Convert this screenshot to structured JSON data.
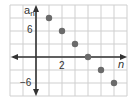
{
  "chart_data": {
    "type": "scatter",
    "title": "",
    "xlabel": "n",
    "ylabel": "a_n",
    "ylabel_display": {
      "base": "a",
      "sub": "n"
    },
    "x": [
      1,
      2,
      3,
      4,
      5,
      6
    ],
    "series": [
      {
        "name": "a_n",
        "values": [
          9,
          6,
          3,
          0,
          -3,
          -6
        ],
        "color": "#6b6b6b"
      }
    ],
    "x_tick_labels": [
      "2"
    ],
    "y_tick_labels": [
      "6",
      "−6"
    ],
    "xlim": [
      -2,
      7
    ],
    "ylim": [
      -9,
      12
    ],
    "grid": true,
    "grid_step": {
      "x": 1,
      "y": 3
    },
    "legend": "none"
  },
  "colors": {
    "grid": "#cfcfcf",
    "axis": "#333333",
    "point": "#6b6b6b"
  }
}
